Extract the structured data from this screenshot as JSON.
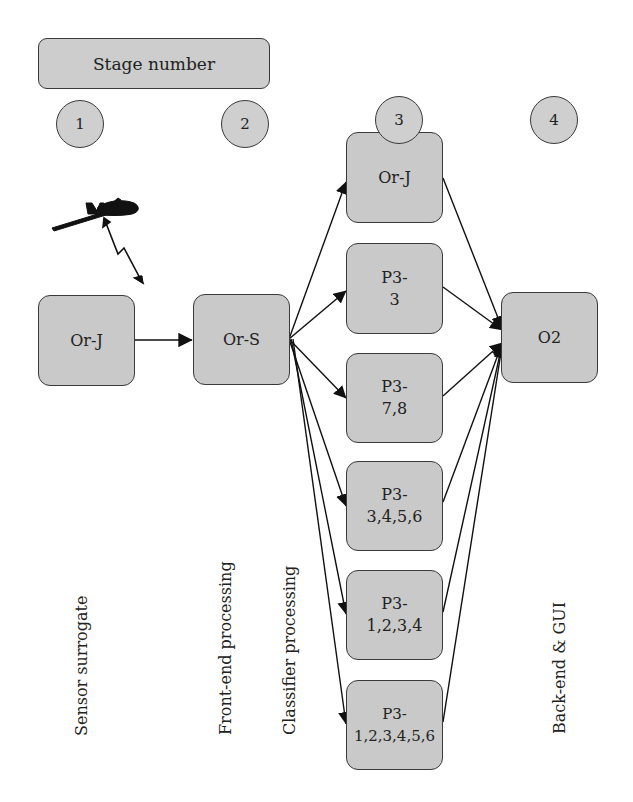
{
  "diagram": {
    "legend": {
      "stage_bar_label": "Stage number"
    },
    "stages": [
      {
        "number": "1",
        "label": "Sensor surrogate"
      },
      {
        "number": "2",
        "label": "Front-end processing"
      },
      {
        "number": "3",
        "label": "Classifier processing"
      },
      {
        "number": "4",
        "label": "Back-end & GUI"
      }
    ],
    "nodes": {
      "sensor_orj": {
        "line1": "Or-J",
        "line2": ""
      },
      "front_ors": {
        "line1": "Or-S",
        "line2": ""
      },
      "classifier": [
        {
          "id": "c_orj",
          "line1": "Or-J",
          "line2": ""
        },
        {
          "id": "c_p3_3",
          "line1": "P3-",
          "line2": "3"
        },
        {
          "id": "c_p3_78",
          "line1": "P3-",
          "line2": "7,8"
        },
        {
          "id": "c_p3_3456",
          "line1": "P3-",
          "line2": "3,4,5,6"
        },
        {
          "id": "c_p3_1234",
          "line1": "P3-",
          "line2": "1,2,3,4"
        },
        {
          "id": "c_p3_123456",
          "line1": "P3-",
          "line2": "1,2,3,4,5,6"
        }
      ],
      "backend_o2": {
        "line1": "O2",
        "line2": ""
      }
    },
    "icons": {
      "sensor": "uav-aircraft-icon",
      "link": "wireless-link-zigzag-icon"
    },
    "edges": [
      {
        "from": "Or-J",
        "to": "Or-S"
      },
      {
        "from": "Or-S",
        "to": "Or-J (stage 3)"
      },
      {
        "from": "Or-S",
        "to": "P3-3"
      },
      {
        "from": "Or-S",
        "to": "P3-7,8"
      },
      {
        "from": "Or-S",
        "to": "P3-3,4,5,6"
      },
      {
        "from": "Or-S",
        "to": "P3-1,2,3,4"
      },
      {
        "from": "Or-S",
        "to": "P3-1,2,3,4,5,6"
      },
      {
        "from": "Or-J (stage 3)",
        "to": "O2"
      },
      {
        "from": "P3-3",
        "to": "O2"
      },
      {
        "from": "P3-7,8",
        "to": "O2"
      },
      {
        "from": "P3-3,4,5,6",
        "to": "O2"
      },
      {
        "from": "P3-1,2,3,4",
        "to": "O2"
      },
      {
        "from": "P3-1,2,3,4,5,6",
        "to": "O2"
      }
    ],
    "colors": {
      "node_fill": "#c9c9c9",
      "stroke": "#3a3a3a",
      "edge": "#111111"
    }
  }
}
